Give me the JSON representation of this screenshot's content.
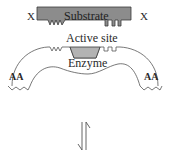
{
  "diagram": {
    "labels": {
      "substrate": "Substrate",
      "x_left": "X",
      "x_right": "X",
      "active_site": "Active site",
      "enzyme": "Enzyme",
      "aa_left": "AA",
      "aa_right": "AA"
    },
    "colors": {
      "substrate_fill": "#8c8c8c",
      "active_site_fill": "#b3b3b3",
      "outline": "#3a3a3a",
      "background": "#ffffff"
    },
    "arrow": {
      "type": "equilibrium-harpoons",
      "direction": "vertical"
    }
  }
}
